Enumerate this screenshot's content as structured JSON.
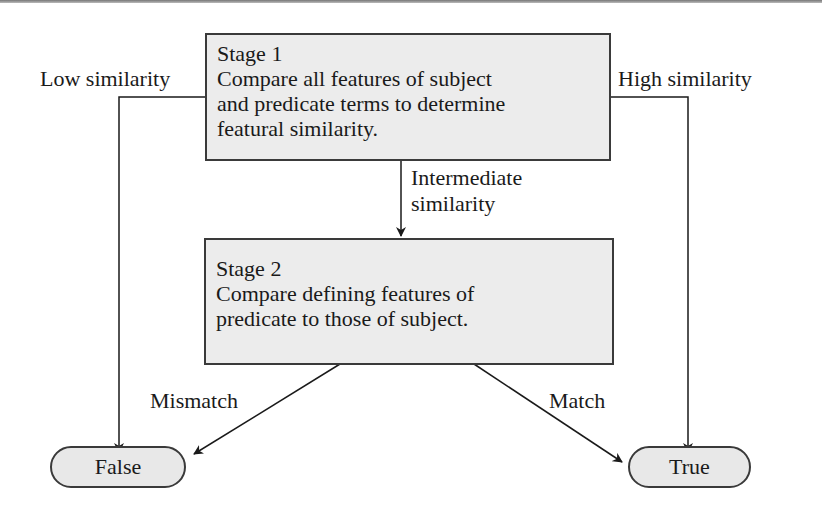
{
  "diagram": {
    "stage1": {
      "title": "Stage 1",
      "lines": [
        "Compare all features of subject",
        "and predicate terms to determine",
        "featural similarity."
      ]
    },
    "stage2": {
      "title": "Stage 2",
      "lines": [
        "Compare defining features of",
        "predicate to those of subject."
      ]
    },
    "edges": {
      "low": "Low similarity",
      "high": "High similarity",
      "intermediate_1": "Intermediate",
      "intermediate_2": "similarity",
      "mismatch": "Mismatch",
      "match": "Match"
    },
    "terminals": {
      "false": "False",
      "true": "True"
    }
  }
}
